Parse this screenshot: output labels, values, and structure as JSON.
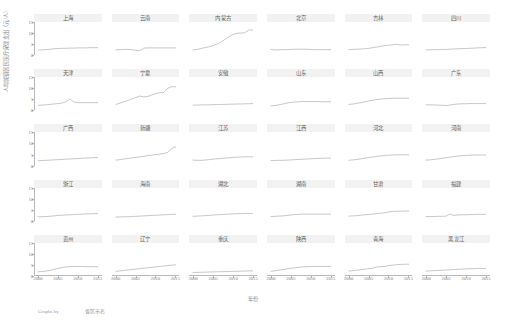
{
  "axes": {
    "ylabel": "人均城镇居民医疗保健支出（元/人）",
    "xlabel": "年份",
    "yticks": [
      "15",
      "10",
      "5",
      "0"
    ],
    "xticks": [
      "2000",
      "2005",
      "2010",
      "2015"
    ],
    "ylim": [
      0,
      15
    ],
    "xlim": [
      1999,
      2016
    ]
  },
  "credit": {
    "by": "Graphs by",
    "source": "省区市名"
  },
  "style": {
    "line_color": "#9a9a9a",
    "title_bg": "#f2f2f2",
    "axis_color": "#b8b8b8"
  },
  "chart_data": {
    "type": "line",
    "title": "",
    "xlabel": "年份",
    "ylabel": "人均城镇居民医疗保健支出（元/人）",
    "xlim": [
      1999,
      2016
    ],
    "ylim": [
      0,
      15
    ],
    "grid": false,
    "legend": "none",
    "layout": {
      "rows": 5,
      "cols": 6,
      "shared_x": true,
      "shared_y": true
    },
    "x": [
      2000,
      2001,
      2002,
      2003,
      2004,
      2005,
      2006,
      2007,
      2008,
      2009,
      2010,
      2011,
      2012,
      2013,
      2014,
      2015
    ],
    "series": [
      {
        "name": "上海",
        "row": 1,
        "col": 1,
        "values": [
          2.3,
          2.4,
          2.5,
          2.7,
          2.9,
          3.0,
          3.1,
          3.1,
          3.2,
          3.2,
          3.3,
          3.3,
          3.3,
          3.4,
          3.4,
          3.4
        ]
      },
      {
        "name": "云南",
        "row": 1,
        "col": 2,
        "values": [
          2.4,
          2.5,
          2.6,
          2.6,
          2.5,
          2.2,
          2.0,
          3.2,
          3.3,
          3.3,
          3.3,
          3.3,
          3.3,
          3.3,
          3.3,
          3.3
        ]
      },
      {
        "name": "内蒙古",
        "row": 1,
        "col": 3,
        "values": [
          2.4,
          2.6,
          3.0,
          3.4,
          3.8,
          4.3,
          5.0,
          5.9,
          7.1,
          8.3,
          9.3,
          9.9,
          10.0,
          10.1,
          11.4,
          11.3
        ]
      },
      {
        "name": "北京",
        "row": 1,
        "col": 4,
        "values": [
          2.6,
          2.4,
          2.4,
          2.5,
          2.5,
          2.6,
          2.7,
          2.7,
          2.7,
          2.7,
          2.6,
          2.5,
          2.5,
          2.5,
          2.5,
          2.5
        ]
      },
      {
        "name": "吉林",
        "row": 1,
        "col": 5,
        "values": [
          2.5,
          2.6,
          2.7,
          2.8,
          2.9,
          3.1,
          3.4,
          3.7,
          4.0,
          4.3,
          4.5,
          4.7,
          4.9,
          4.6,
          4.7,
          4.7
        ]
      },
      {
        "name": "四川",
        "row": 1,
        "col": 6,
        "values": [
          2.4,
          2.4,
          2.5,
          2.5,
          2.6,
          2.6,
          2.7,
          2.8,
          2.9,
          3.0,
          3.0,
          3.1,
          3.2,
          3.3,
          3.4,
          3.4
        ]
      },
      {
        "name": "天津",
        "row": 2,
        "col": 1,
        "values": [
          2.2,
          2.3,
          2.4,
          2.6,
          2.8,
          3.0,
          3.2,
          3.8,
          5.0,
          3.7,
          3.4,
          3.4,
          3.4,
          3.4,
          3.4,
          3.4
        ]
      },
      {
        "name": "宁夏",
        "row": 2,
        "col": 2,
        "values": [
          2.6,
          3.2,
          3.8,
          4.4,
          5.1,
          5.7,
          6.4,
          6.0,
          6.2,
          6.9,
          7.5,
          7.9,
          8.0,
          9.9,
          10.6,
          10.6
        ]
      },
      {
        "name": "安徽",
        "row": 2,
        "col": 3,
        "values": [
          2.3,
          2.3,
          2.4,
          2.4,
          2.4,
          2.5,
          2.5,
          2.6,
          2.6,
          2.7,
          2.7,
          2.8,
          2.8,
          2.9,
          2.9,
          3.0
        ]
      },
      {
        "name": "山东",
        "row": 2,
        "col": 4,
        "values": [
          1.9,
          2.1,
          2.4,
          2.8,
          3.2,
          3.5,
          3.7,
          3.8,
          3.9,
          3.9,
          3.9,
          3.9,
          3.9,
          3.8,
          3.8,
          3.8
        ]
      },
      {
        "name": "山西",
        "row": 2,
        "col": 5,
        "values": [
          2.6,
          2.8,
          3.1,
          3.4,
          3.8,
          4.2,
          4.5,
          4.8,
          5.0,
          5.2,
          5.3,
          5.4,
          5.4,
          5.4,
          5.4,
          5.4
        ]
      },
      {
        "name": "广东",
        "row": 2,
        "col": 6,
        "values": [
          2.4,
          2.4,
          2.4,
          2.3,
          2.2,
          2.1,
          2.3,
          2.6,
          2.8,
          2.9,
          2.9,
          3.0,
          3.0,
          3.0,
          3.0,
          3.0
        ]
      },
      {
        "name": "广西",
        "row": 3,
        "col": 1,
        "values": [
          2.0,
          2.1,
          2.2,
          2.3,
          2.4,
          2.5,
          2.6,
          2.7,
          2.8,
          2.9,
          3.0,
          3.1,
          3.2,
          3.3,
          3.4,
          3.4
        ]
      },
      {
        "name": "新疆",
        "row": 3,
        "col": 2,
        "values": [
          2.3,
          2.5,
          2.8,
          3.0,
          3.3,
          3.5,
          3.8,
          4.0,
          4.3,
          4.5,
          4.8,
          5.0,
          5.3,
          5.8,
          7.5,
          8.3
        ]
      },
      {
        "name": "江苏",
        "row": 3,
        "col": 3,
        "values": [
          2.3,
          2.2,
          2.2,
          2.3,
          2.5,
          2.7,
          2.9,
          3.0,
          3.2,
          3.3,
          3.5,
          3.6,
          3.7,
          3.8,
          3.8,
          3.8
        ]
      },
      {
        "name": "江西",
        "row": 3,
        "col": 4,
        "values": [
          2.1,
          2.1,
          2.2,
          2.2,
          2.3,
          2.4,
          2.5,
          2.6,
          2.7,
          2.8,
          2.9,
          3.0,
          3.1,
          3.1,
          3.2,
          3.2
        ]
      },
      {
        "name": "河北",
        "row": 3,
        "col": 5,
        "values": [
          2.2,
          2.4,
          2.6,
          2.9,
          3.2,
          3.5,
          3.7,
          4.0,
          4.2,
          4.4,
          4.5,
          4.6,
          4.7,
          4.7,
          4.7,
          4.7
        ]
      },
      {
        "name": "河南",
        "row": 3,
        "col": 6,
        "values": [
          2.3,
          2.4,
          2.6,
          2.8,
          3.1,
          3.4,
          3.6,
          3.9,
          4.1,
          4.3,
          4.4,
          4.5,
          4.6,
          4.6,
          4.6,
          4.6
        ]
      },
      {
        "name": "浙江",
        "row": 4,
        "col": 1,
        "values": [
          2.0,
          2.0,
          2.1,
          2.2,
          2.4,
          2.6,
          2.7,
          2.8,
          2.9,
          3.0,
          3.1,
          3.2,
          3.3,
          3.3,
          3.4,
          3.4
        ]
      },
      {
        "name": "海南",
        "row": 4,
        "col": 2,
        "values": [
          1.9,
          1.9,
          2.0,
          2.0,
          2.1,
          2.2,
          2.3,
          2.4,
          2.5,
          2.6,
          2.7,
          2.8,
          2.9,
          3.0,
          3.1,
          3.1
        ]
      },
      {
        "name": "湖北",
        "row": 4,
        "col": 3,
        "values": [
          2.2,
          2.3,
          2.4,
          2.5,
          2.6,
          2.8,
          2.9,
          3.0,
          3.1,
          3.2,
          3.3,
          3.4,
          3.4,
          3.5,
          3.5,
          3.5
        ]
      },
      {
        "name": "湖南",
        "row": 4,
        "col": 4,
        "values": [
          2.1,
          2.2,
          2.3,
          2.4,
          2.6,
          2.8,
          3.0,
          3.1,
          3.2,
          3.2,
          3.2,
          3.2,
          3.2,
          3.2,
          3.2,
          3.2
        ]
      },
      {
        "name": "甘肃",
        "row": 4,
        "col": 5,
        "values": [
          2.3,
          2.4,
          2.5,
          2.7,
          2.9,
          3.0,
          3.2,
          3.4,
          3.6,
          3.8,
          4.2,
          4.4,
          4.5,
          4.5,
          4.6,
          4.6
        ]
      },
      {
        "name": "福建",
        "row": 4,
        "col": 6,
        "values": [
          2.1,
          2.1,
          2.1,
          2.2,
          2.2,
          2.3,
          3.2,
          2.6,
          2.8,
          2.9,
          2.9,
          3.0,
          3.0,
          3.1,
          3.1,
          3.1
        ]
      },
      {
        "name": "贵州",
        "row": 5,
        "col": 1,
        "values": [
          2.0,
          2.1,
          2.3,
          2.6,
          3.0,
          3.5,
          3.9,
          4.2,
          4.3,
          4.4,
          4.4,
          4.4,
          4.3,
          4.3,
          4.3,
          4.3
        ]
      },
      {
        "name": "辽宁",
        "row": 5,
        "col": 2,
        "values": [
          2.2,
          2.4,
          2.6,
          2.8,
          3.0,
          3.2,
          3.4,
          3.6,
          3.8,
          4.0,
          4.2,
          4.4,
          4.6,
          4.8,
          5.0,
          5.1
        ]
      },
      {
        "name": "重庆",
        "row": 5,
        "col": 3,
        "values": [
          1.7,
          1.7,
          1.8,
          1.8,
          1.9,
          1.9,
          2.0,
          2.0,
          2.1,
          2.1,
          2.2,
          2.2,
          2.3,
          2.3,
          2.4,
          2.4
        ]
      },
      {
        "name": "陕西",
        "row": 5,
        "col": 4,
        "values": [
          2.2,
          2.4,
          2.7,
          3.0,
          3.3,
          3.6,
          3.8,
          4.0,
          4.2,
          4.3,
          4.4,
          4.4,
          4.4,
          4.4,
          4.4,
          4.4
        ]
      },
      {
        "name": "青海",
        "row": 5,
        "col": 5,
        "values": [
          2.3,
          2.5,
          2.7,
          2.9,
          3.2,
          3.4,
          3.6,
          4.2,
          4.3,
          4.4,
          4.8,
          5.0,
          5.2,
          5.3,
          5.4,
          5.4
        ]
      },
      {
        "name": "黑龙江",
        "row": 5,
        "col": 6,
        "values": [
          2.3,
          2.4,
          2.5,
          2.6,
          2.7,
          2.8,
          2.9,
          3.0,
          3.1,
          3.2,
          3.3,
          3.4,
          3.4,
          3.5,
          3.5,
          3.5
        ]
      }
    ]
  }
}
